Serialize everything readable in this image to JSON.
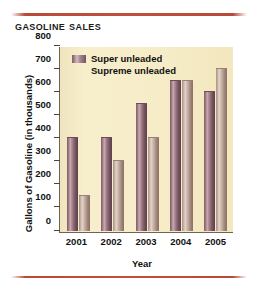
{
  "chart_data": {
    "type": "bar",
    "title": "Gasoline Sales",
    "xlabel": "Year",
    "ylabel": "Gallons of Gasoline (in thousands)",
    "categories": [
      "2001",
      "2002",
      "2003",
      "2004",
      "2005"
    ],
    "series": [
      {
        "name": "Super unleaded",
        "values": [
          400,
          400,
          550,
          650,
          600
        ]
      },
      {
        "name": "Supreme unleaded",
        "values": [
          150,
          300,
          400,
          650,
          700
        ]
      }
    ],
    "ylim": [
      0,
      800
    ],
    "yticks": [
      0,
      100,
      200,
      300,
      400,
      500,
      600,
      700,
      800
    ],
    "ytick_labels": [
      "0",
      "100",
      "200",
      "300",
      "400",
      "500",
      "600",
      "700",
      "800"
    ],
    "grid": false,
    "legend_position": "top-left-inside",
    "colors": {
      "super_unleaded": "#8e6b76",
      "supreme_unleaded": "#c4ada2",
      "plot_background": "#f5ebc6",
      "axis": "#6d6455",
      "rule": "#bd4b3a",
      "text": "#111111"
    }
  }
}
